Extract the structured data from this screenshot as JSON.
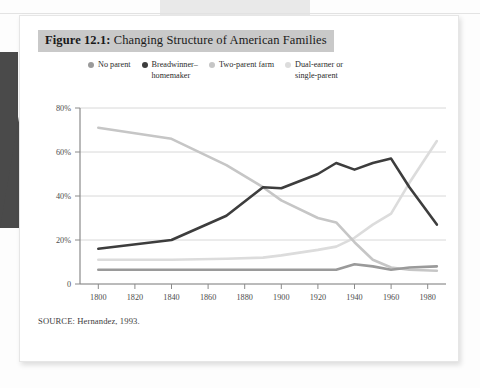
{
  "figure": {
    "number_label": "Figure 12.1:",
    "title": "Changing Structure of American Families",
    "source": "SOURCE: Hernandez, 1993."
  },
  "colors": {
    "no_parent": "#9a9a9a",
    "breadwinner_homemaker": "#3d3d3d",
    "two_parent_farm": "#c6c6c6",
    "dual_earner_single_parent": "#dcdcdc",
    "grid": "#d8d8d8",
    "axis": "#8a8a8a",
    "title_highlight": "#c9c9c9",
    "card_background": "#ffffff"
  },
  "chart_data": {
    "type": "line",
    "title": "Changing Structure of American Families",
    "xlabel": "",
    "ylabel": "",
    "xlim": [
      1790,
      1990
    ],
    "ylim": [
      0,
      80
    ],
    "grid": true,
    "legend_position": "top",
    "x_ticks": [
      1800,
      1820,
      1840,
      1860,
      1880,
      1900,
      1920,
      1940,
      1960,
      1980
    ],
    "x_tick_labels": [
      "1800",
      "1820",
      "1840",
      "1860",
      "1880",
      "1900",
      "1920",
      "1940",
      "1960",
      "1980"
    ],
    "y_ticks": [
      0,
      20,
      40,
      60,
      80
    ],
    "y_tick_labels": [
      "0",
      "20%",
      "40%",
      "60%",
      "80%"
    ],
    "series": [
      {
        "name": "No parent",
        "color": "#9a9a9a",
        "x": [
          1800,
          1840,
          1870,
          1890,
          1900,
          1920,
          1930,
          1940,
          1950,
          1960,
          1970,
          1985
        ],
        "values": [
          6.5,
          6.5,
          6.5,
          6.5,
          6.5,
          6.5,
          6.5,
          9.0,
          8.0,
          6.5,
          7.5,
          8.0
        ]
      },
      {
        "name": "Breadwinner–homemaker",
        "color": "#3d3d3d",
        "x": [
          1800,
          1840,
          1870,
          1890,
          1900,
          1920,
          1930,
          1940,
          1950,
          1960,
          1970,
          1985
        ],
        "values": [
          16.0,
          20.0,
          31.0,
          44.0,
          43.5,
          50.0,
          55.0,
          52.0,
          55.0,
          57.0,
          44.0,
          27.0
        ]
      },
      {
        "name": "Two-parent farm",
        "color": "#c6c6c6",
        "x": [
          1800,
          1840,
          1870,
          1890,
          1900,
          1920,
          1930,
          1940,
          1950,
          1960,
          1970,
          1985
        ],
        "values": [
          71.0,
          66.0,
          54.0,
          44.0,
          38.0,
          30.0,
          28.0,
          19.0,
          11.0,
          7.5,
          6.5,
          6.0
        ]
      },
      {
        "name": "Dual-earner or single-parent",
        "color": "#dcdcdc",
        "x": [
          1800,
          1840,
          1870,
          1890,
          1900,
          1920,
          1930,
          1940,
          1950,
          1960,
          1970,
          1985
        ],
        "values": [
          11.0,
          11.0,
          11.5,
          12.0,
          13.0,
          15.5,
          17.0,
          21.0,
          27.0,
          32.0,
          46.0,
          65.0
        ]
      }
    ]
  },
  "legend": {
    "items": [
      {
        "label": "No parent",
        "color_key": "no_parent"
      },
      {
        "label": "Breadwinner–\nhomemaker",
        "color_key": "breadwinner_homemaker"
      },
      {
        "label": "Two-parent farm",
        "color_key": "two_parent_farm"
      },
      {
        "label": "Dual-earner or\nsingle-parent",
        "color_key": "dual_earner_single_parent"
      }
    ]
  }
}
